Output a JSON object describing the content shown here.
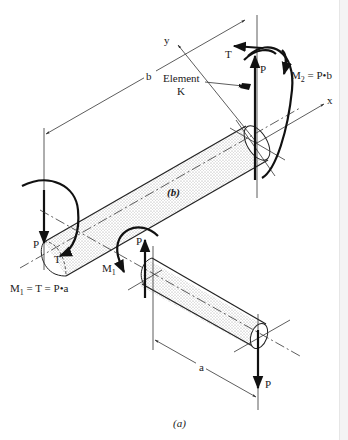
{
  "figure": {
    "panel_b": {
      "caption": "(b)",
      "axes": {
        "x": "x",
        "y": "y"
      },
      "dimension": "b",
      "element_label_line1": "Element",
      "element_label_line2": "K",
      "loads": {
        "P_top": "P",
        "T_top": "T",
        "M2_eq": "M",
        "M2_sub": "2",
        "M2_rhs": " = P•b",
        "P_left": "P",
        "T_left": "T"
      }
    },
    "panel_a": {
      "caption": "(a)",
      "dimension": "a",
      "loads": {
        "P_up": "P",
        "M1": "M",
        "M1_sub": "1",
        "P_down": "P"
      }
    },
    "equation_m1": {
      "lhs": "M",
      "sub": "1",
      "rhs": " = T = P•a"
    }
  },
  "colors": {
    "ink": "#111111",
    "shading": "#d8d8d8",
    "background": "#ffffff"
  }
}
